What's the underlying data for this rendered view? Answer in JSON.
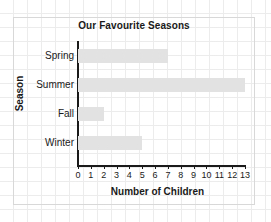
{
  "chart_data": {
    "type": "bar",
    "orientation": "horizontal",
    "title": "Our Favourite Seasons",
    "xlabel": "Number of Children",
    "ylabel": "Season",
    "categories": [
      "Spring",
      "Summer",
      "Fall",
      "Winter"
    ],
    "values": [
      7,
      13,
      2,
      5
    ],
    "xlim": [
      0,
      13
    ],
    "xticks": [
      0,
      1,
      2,
      3,
      4,
      5,
      6,
      7,
      8,
      9,
      10,
      11,
      12,
      13
    ],
    "xtick_labels": [
      "0",
      "1",
      "2",
      "3",
      "4",
      "5",
      "6",
      "7",
      "8",
      "9",
      "10",
      "11",
      "12",
      "13"
    ],
    "grid": true,
    "grid_style": "graph-paper-background",
    "legend": null,
    "bar_color": "#e2e2e2",
    "axis_color": "#1a1a1a",
    "background_color": "#ffffff",
    "grid_color": "#ececec",
    "frame_color": "#d8d8d8"
  }
}
